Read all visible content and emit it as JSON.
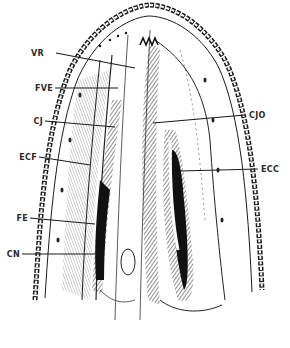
{
  "figure": {
    "title": "",
    "colors": {
      "ink": "#1a1a1a",
      "paper": "#ffffff",
      "shade": "#3a3a3a"
    }
  },
  "labels": [
    {
      "id": "VR",
      "text": "VR",
      "side": "left"
    },
    {
      "id": "FVE",
      "text": "FVE",
      "side": "left"
    },
    {
      "id": "CJ",
      "text": "CJ",
      "side": "left"
    },
    {
      "id": "ECF",
      "text": "ECF",
      "side": "left"
    },
    {
      "id": "FE",
      "text": "FE",
      "side": "left"
    },
    {
      "id": "CN",
      "text": "CN",
      "side": "left"
    },
    {
      "id": "CJO",
      "text": "CJO",
      "side": "right"
    },
    {
      "id": "ECC",
      "text": "ECC",
      "side": "right"
    }
  ]
}
